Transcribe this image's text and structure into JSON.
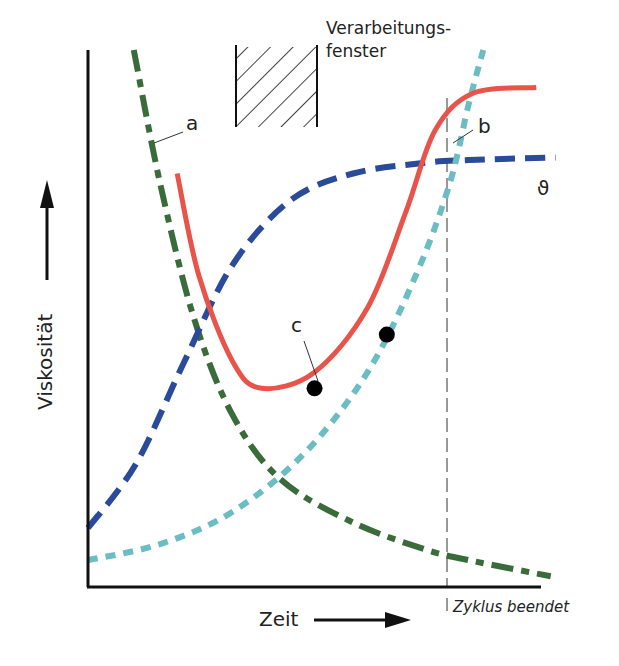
{
  "chart_data": {
    "type": "line",
    "title": "",
    "xlabel": "Zeit",
    "ylabel": "Viskosität",
    "x_marker_label": "Zyklus beendet",
    "window_label_line1": "Verarbeitungs-",
    "window_label_line2": "fenster",
    "x_range": [
      0,
      1
    ],
    "y_range": [
      0,
      1
    ],
    "cycle_end_x": 0.79,
    "series": [
      {
        "name": "a",
        "label": "a",
        "style": "dash-dot",
        "color": "#3a6b3a",
        "points": [
          [
            0.095,
            1.0
          ],
          [
            0.15,
            0.75
          ],
          [
            0.22,
            0.5
          ],
          [
            0.3,
            0.32
          ],
          [
            0.4,
            0.2
          ],
          [
            0.55,
            0.12
          ],
          [
            0.7,
            0.07
          ],
          [
            0.79,
            0.05
          ],
          [
            0.96,
            0.02
          ]
        ]
      },
      {
        "name": "theta",
        "label": "ϑ",
        "style": "dashed",
        "color": "#2a4a9a",
        "points": [
          [
            0.0,
            0.11
          ],
          [
            0.1,
            0.23
          ],
          [
            0.2,
            0.42
          ],
          [
            0.3,
            0.6
          ],
          [
            0.42,
            0.72
          ],
          [
            0.55,
            0.77
          ],
          [
            0.7,
            0.79
          ],
          [
            0.79,
            0.795
          ],
          [
            0.97,
            0.8
          ]
        ]
      },
      {
        "name": "b",
        "label": "b",
        "style": "dotted",
        "color": "#6cbcc4",
        "points": [
          [
            0.0,
            0.05
          ],
          [
            0.15,
            0.08
          ],
          [
            0.3,
            0.14
          ],
          [
            0.45,
            0.25
          ],
          [
            0.58,
            0.4
          ],
          [
            0.68,
            0.58
          ],
          [
            0.75,
            0.75
          ],
          [
            0.79,
            0.9
          ],
          [
            0.82,
            1.0
          ]
        ]
      },
      {
        "name": "c",
        "label": "c",
        "style": "solid",
        "color": "#e8544a",
        "points": [
          [
            0.185,
            0.77
          ],
          [
            0.23,
            0.58
          ],
          [
            0.3,
            0.42
          ],
          [
            0.36,
            0.37
          ],
          [
            0.47,
            0.4
          ],
          [
            0.58,
            0.52
          ],
          [
            0.66,
            0.7
          ],
          [
            0.72,
            0.85
          ],
          [
            0.8,
            0.92
          ],
          [
            0.93,
            0.93
          ]
        ]
      }
    ],
    "markers": [
      {
        "series": "c",
        "x": 0.47,
        "y": 0.37
      },
      {
        "series": "c",
        "x": 0.62,
        "y": 0.47
      }
    ],
    "processing_window": {
      "x_start": 0.33,
      "x_end": 0.5
    },
    "grid": false
  }
}
